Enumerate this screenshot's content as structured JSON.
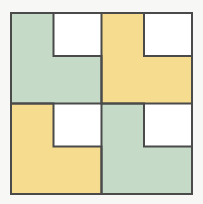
{
  "figure": {
    "title": "Four congruent L-shaped tiles arranged in a 2 by 2 checkerboard square",
    "background_color": "#f7f7f5",
    "outline_color": "#4a4a4a",
    "outline_width": 2,
    "white_notch_color": "#ffffff",
    "palette": {
      "green": "#c5dbc8",
      "yellow": "#f6dc8e"
    },
    "board": {
      "x": 11,
      "y": 13,
      "width": 181,
      "height": 181,
      "rows": 2,
      "columns": 2,
      "cell_width": 90.5,
      "cell_height": 90.5
    },
    "notch": {
      "position": "top-right",
      "width": 48,
      "height": 43
    },
    "tiles": [
      {
        "id": "tile-top-left",
        "label": "Top left L-tile",
        "row": 0,
        "column": 0,
        "color_name": "green",
        "color": "#c5dbc8",
        "x": 11,
        "y": 13,
        "width": 90.5,
        "height": 90.5
      },
      {
        "id": "tile-top-right",
        "label": "Top right L-tile",
        "row": 0,
        "column": 1,
        "color_name": "yellow",
        "color": "#f6dc8e",
        "x": 101.5,
        "y": 13,
        "width": 90.5,
        "height": 90.5
      },
      {
        "id": "tile-bottom-left",
        "label": "Bottom left L-tile",
        "row": 1,
        "column": 0,
        "color_name": "yellow",
        "color": "#f6dc8e",
        "x": 11,
        "y": 103.5,
        "width": 90.5,
        "height": 90.5
      },
      {
        "id": "tile-bottom-right",
        "label": "Bottom right L-tile",
        "row": 1,
        "column": 1,
        "color_name": "green",
        "color": "#c5dbc8",
        "x": 101.5,
        "y": 103.5,
        "width": 90.5,
        "height": 90.5
      }
    ]
  }
}
